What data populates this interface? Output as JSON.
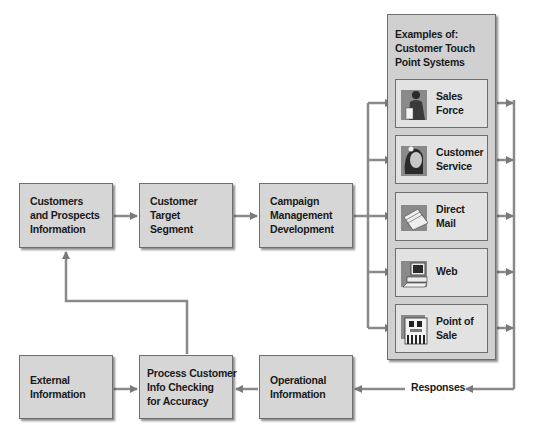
{
  "diagram": {
    "top_row": [
      {
        "id": "customers",
        "lines": [
          "Customers",
          "and Prospects",
          "Information"
        ]
      },
      {
        "id": "target",
        "lines": [
          "Customer",
          "Target",
          "Segment"
        ]
      },
      {
        "id": "campaign",
        "lines": [
          "Campaign",
          "Management",
          "Development"
        ]
      }
    ],
    "bottom_row": [
      {
        "id": "external",
        "lines": [
          "External",
          "Information"
        ]
      },
      {
        "id": "process",
        "lines": [
          "Process Customer",
          "Info Checking",
          "for Accuracy"
        ]
      },
      {
        "id": "operational",
        "lines": [
          "Operational",
          "Information"
        ]
      }
    ],
    "touch_points": {
      "title_lines": [
        "Examples of:",
        "Customer Touch",
        "Point Systems"
      ],
      "items": [
        {
          "icon": "salesperson-icon",
          "lines": [
            "Sales",
            "Force"
          ]
        },
        {
          "icon": "headset-agent-icon",
          "lines": [
            "Customer",
            "Service"
          ]
        },
        {
          "icon": "envelopes-icon",
          "lines": [
            "Direct",
            "Mail"
          ]
        },
        {
          "icon": "computer-icon",
          "lines": [
            "Web",
            ""
          ]
        },
        {
          "icon": "storefront-icon",
          "lines": [
            "Point of",
            "Sale"
          ]
        }
      ]
    },
    "responses_label": "Responses",
    "colors": {
      "box_fill": "#d6d6d6",
      "inner_box_fill": "#e2e2e2",
      "border": "#6e6e6e",
      "connector": "#7a7a7a",
      "icon_bg": "#8a8a8a"
    }
  }
}
